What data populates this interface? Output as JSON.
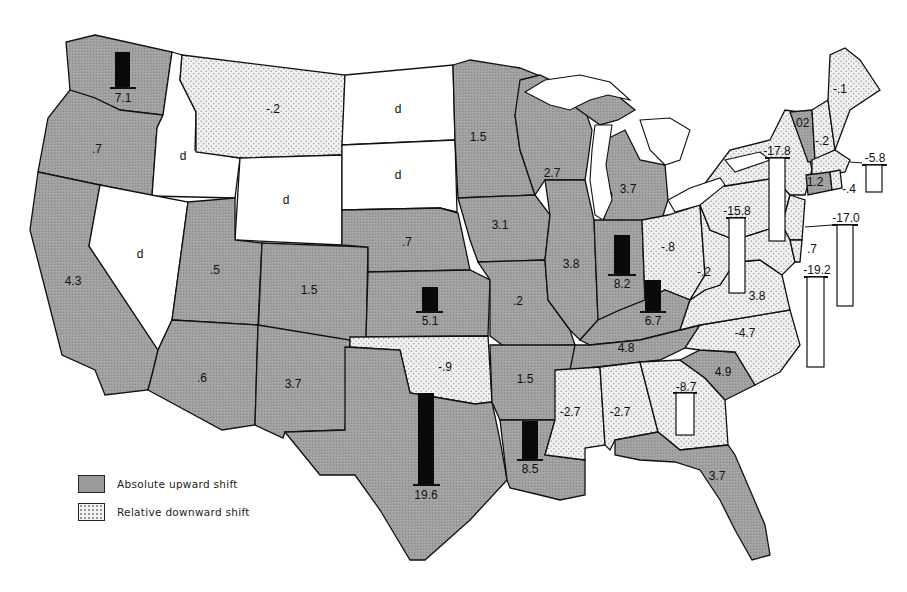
{
  "legend": {
    "items": [
      {
        "key": "up",
        "label": "Absolute upward shift"
      },
      {
        "key": "down",
        "label": "Relative downward shift"
      }
    ]
  },
  "colors": {
    "upward_fill": "#9a9a9a",
    "downward_fill": "#f2f2f2",
    "no_data_fill": "#ffffff",
    "bar_upward": "#0a0a0a",
    "bar_downward": "#ffffff"
  },
  "states": [
    {
      "id": "WA",
      "category": "up",
      "value": "7.1",
      "has_bar": true
    },
    {
      "id": "OR",
      "category": "up",
      "value": ".7"
    },
    {
      "id": "CA",
      "category": "up",
      "value": "4.3"
    },
    {
      "id": "ID",
      "category": "d",
      "value": "d"
    },
    {
      "id": "NV",
      "category": "d",
      "value": "d"
    },
    {
      "id": "MT",
      "category": "down",
      "value": "-.2"
    },
    {
      "id": "WY",
      "category": "d",
      "value": "d"
    },
    {
      "id": "ND",
      "category": "d",
      "value": "d"
    },
    {
      "id": "SD",
      "category": "d",
      "value": "d"
    },
    {
      "id": "UT",
      "category": "up",
      "value": ".5"
    },
    {
      "id": "CO",
      "category": "up",
      "value": "1.5"
    },
    {
      "id": "AZ",
      "category": "up",
      "value": ".6"
    },
    {
      "id": "NM",
      "category": "up",
      "value": "3.7"
    },
    {
      "id": "NE",
      "category": "up",
      "value": ".7"
    },
    {
      "id": "KS",
      "category": "up",
      "value": "5.1",
      "has_bar": true
    },
    {
      "id": "OK",
      "category": "down",
      "value": "-.9"
    },
    {
      "id": "TX",
      "category": "up",
      "value": "19.6",
      "has_bar": true
    },
    {
      "id": "MN",
      "category": "up",
      "value": "1.5"
    },
    {
      "id": "IA",
      "category": "up",
      "value": "3.1"
    },
    {
      "id": "MO",
      "category": "up",
      "value": ".2"
    },
    {
      "id": "AR",
      "category": "up",
      "value": "1.5"
    },
    {
      "id": "LA",
      "category": "up",
      "value": "8.5",
      "has_bar": true
    },
    {
      "id": "WI",
      "category": "up",
      "value": "2.7"
    },
    {
      "id": "IL",
      "category": "up",
      "value": "3.8"
    },
    {
      "id": "MI",
      "category": "up",
      "value": "3.7"
    },
    {
      "id": "IN",
      "category": "up",
      "value": "8.2",
      "has_bar": true
    },
    {
      "id": "KY",
      "category": "up",
      "value": "6.7",
      "has_bar": true
    },
    {
      "id": "TN",
      "category": "up",
      "value": "4.8"
    },
    {
      "id": "MS",
      "category": "down",
      "value": "-2.7"
    },
    {
      "id": "AL",
      "category": "down",
      "value": "-2.7"
    },
    {
      "id": "GA",
      "category": "down",
      "value": "-8.7",
      "has_bar": true
    },
    {
      "id": "FL",
      "category": "up",
      "value": "3.7"
    },
    {
      "id": "SC",
      "category": "up",
      "value": "4.9"
    },
    {
      "id": "NC",
      "category": "down",
      "value": "-4.7"
    },
    {
      "id": "VA",
      "category": "down",
      "value": "-3.8"
    },
    {
      "id": "WV",
      "category": "down",
      "value": "-.2"
    },
    {
      "id": "OH",
      "category": "down",
      "value": "-.8"
    },
    {
      "id": "PA",
      "category": "down",
      "value": "-15.8",
      "has_bar": true
    },
    {
      "id": "NY",
      "category": "down",
      "value": "-17.8",
      "has_bar": true
    },
    {
      "id": "NJ",
      "category": "down",
      "value": "-17.0",
      "has_bar": true
    },
    {
      "id": "DE",
      "category": "down",
      "value": ".7"
    },
    {
      "id": "MD",
      "category": "down",
      "value": "-19.2",
      "has_bar": true
    },
    {
      "id": "VT",
      "category": "up",
      "value": ".02"
    },
    {
      "id": "NH",
      "category": "down",
      "value": "-.2"
    },
    {
      "id": "ME",
      "category": "down",
      "value": "-.1"
    },
    {
      "id": "MA",
      "category": "down",
      "value": "-5.8",
      "has_bar": true
    },
    {
      "id": "CT",
      "category": "up",
      "value": "1.2"
    },
    {
      "id": "RI",
      "category": "down",
      "value": "-.4"
    }
  ],
  "labels": {
    "WA": "7.1",
    "OR": ".7",
    "CA": "4.3",
    "ID": "d",
    "NV": "d",
    "MT": "-.2",
    "WY": "d",
    "ND": "d",
    "SD": "d",
    "UT": ".5",
    "CO": "1.5",
    "AZ": ".6",
    "NM": "3.7",
    "NE": ".7",
    "KS": "5.1",
    "OK": "-.9",
    "TX": "19.6",
    "MN": "1.5",
    "IA": "3.1",
    "MO": ".2",
    "AR": "1.5",
    "LA": "8.5",
    "WI": "2.7",
    "IL": "3.8",
    "MI": "3.7",
    "IN": "8.2",
    "KY": "6.7",
    "TN": "4.8",
    "MS": "-2.7",
    "AL": "-2.7",
    "GA": "-8.7",
    "FL": "3.7",
    "SC": "4.9",
    "NC": "-4.7",
    "VA": "3.8",
    "WV": "-.2",
    "OH": "-.8",
    "PA": "-15.8",
    "NY": "-17.8",
    "NJ": "-17.0",
    "DE": ".7",
    "MD": "-19.2",
    "VT": ".02",
    "NH": "-.2",
    "ME": "-.1",
    "MA": "-5.8",
    "CT": "1.2",
    "RI": "-.4"
  }
}
